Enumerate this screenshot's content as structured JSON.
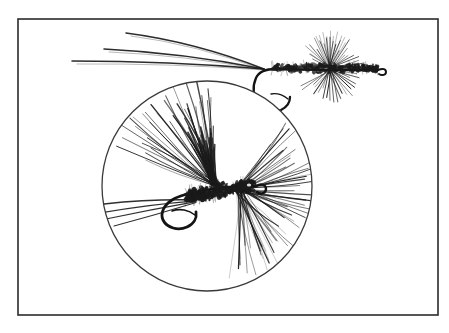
{
  "figure": {
    "caption": "",
    "background_color": "#ffffff",
    "ink_color": "#1a1a1a",
    "frame": {
      "label": "illustration border",
      "stroke_color": "#2b2b2b",
      "stroke_width": 1.6,
      "x": 18,
      "y": 19,
      "width": 420,
      "height": 296
    },
    "magnifier": {
      "label": "magnifying circle",
      "stroke_color": "#3a3a3a",
      "stroke_width": 1.3,
      "center_x": 207,
      "center_y": 186,
      "radius": 105
    },
    "flies": [
      {
        "name": "upper-fly",
        "label": "dry fly, actual size",
        "hook_eye_x": 383,
        "hook_bend_x": 262,
        "shank_y": 68,
        "tail_fiber_count": 3,
        "hackle_fiber_count": 46,
        "body_style": "dubbed",
        "orientation": "eye-right"
      },
      {
        "name": "magnified-fly",
        "label": "dry fly, magnified detail",
        "hook_eye_x": 262,
        "hook_bend_x": 172,
        "shank_y": 196,
        "tail_fiber_count": 4,
        "wing_fiber_count": 34,
        "hackle_fiber_count": 52,
        "body_style": "dubbed",
        "orientation": "eye-right"
      }
    ]
  }
}
